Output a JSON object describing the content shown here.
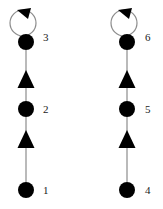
{
  "diagram": {
    "title": "",
    "type": "directed-graph",
    "canvas": {
      "width": 163,
      "height": 209
    },
    "style": {
      "node_fill": "#000000",
      "node_radius": 8,
      "edge_color": "#8c8c8c",
      "edge_width": 1.2,
      "arrow_fill": "#000000",
      "label_color": "#1a1a1a",
      "background": "#ffffff"
    },
    "components": [
      {
        "name": "left-chain",
        "nodes": [
          {
            "id": "1",
            "label": "1",
            "cx": 26,
            "cy": 190,
            "label_x": 43,
            "label_y": 194
          },
          {
            "id": "2",
            "label": "2",
            "cx": 26,
            "cy": 109,
            "label_x": 43,
            "label_y": 113
          },
          {
            "id": "3",
            "label": "3",
            "cx": 26,
            "cy": 42,
            "label_x": 43,
            "label_y": 41
          }
        ],
        "edges": [
          {
            "from": "1",
            "to": "2",
            "x": 26,
            "y1": 182,
            "y2": 117,
            "arrow_y": 139
          },
          {
            "from": "2",
            "to": "3",
            "x": 26,
            "y1": 101,
            "y2": 50,
            "arrow_y": 79
          }
        ],
        "self_loops": [
          {
            "on": "3",
            "cx": 23,
            "cy": 23,
            "r": 13,
            "arrow_x": 25,
            "arrow_y": 8
          }
        ]
      },
      {
        "name": "right-chain",
        "nodes": [
          {
            "id": "4",
            "label": "4",
            "cx": 127,
            "cy": 190,
            "label_x": 145,
            "label_y": 194
          },
          {
            "id": "5",
            "label": "5",
            "cx": 127,
            "cy": 109,
            "label_x": 145,
            "label_y": 113
          },
          {
            "id": "6",
            "label": "6",
            "cx": 127,
            "cy": 42,
            "label_x": 145,
            "label_y": 41
          }
        ],
        "edges": [
          {
            "from": "4",
            "to": "5",
            "x": 127,
            "y1": 182,
            "y2": 117,
            "arrow_y": 139
          },
          {
            "from": "5",
            "to": "6",
            "x": 127,
            "y1": 101,
            "y2": 50,
            "arrow_y": 79
          }
        ],
        "self_loops": [
          {
            "on": "6",
            "cx": 124,
            "cy": 23,
            "r": 13,
            "arrow_x": 126,
            "arrow_y": 8
          }
        ]
      }
    ],
    "labels": {
      "n1": "1",
      "n2": "2",
      "n3": "3",
      "n4": "4",
      "n5": "5",
      "n6": "6"
    }
  }
}
